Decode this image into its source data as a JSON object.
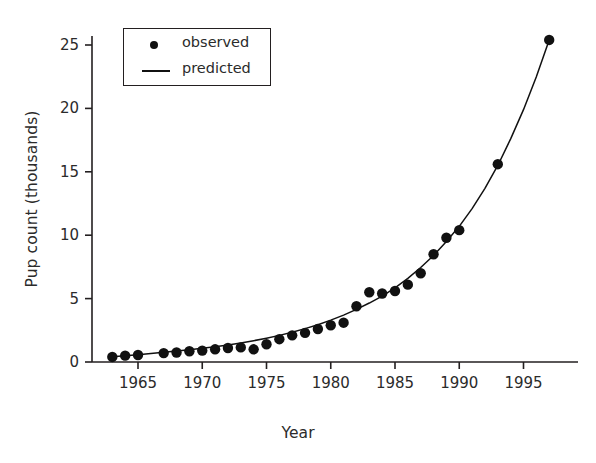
{
  "chart_data": {
    "type": "scatter",
    "title": "",
    "xlabel": "Year",
    "ylabel": "Pup count (thousands)",
    "xlim": [
      1962.0,
      1998.5
    ],
    "ylim": [
      -0.4,
      26.6
    ],
    "xticks": [
      1965,
      1970,
      1975,
      1980,
      1985,
      1990,
      1995
    ],
    "yticks": [
      0,
      5,
      10,
      15,
      20,
      25
    ],
    "xtick_labels": [
      "1965",
      "1970",
      "1975",
      "1980",
      "1985",
      "1990",
      "1995"
    ],
    "ytick_labels": [
      "0",
      "5",
      "10",
      "15",
      "20",
      "25"
    ],
    "grid": false,
    "legend_position": "upper left",
    "legend": [
      {
        "label": "observed",
        "symbol": "dot"
      },
      {
        "label": "predicted",
        "symbol": "line"
      }
    ],
    "series": [
      {
        "name": "observed",
        "type": "scatter",
        "marker": "circle",
        "color": "#111111",
        "x": [
          1963,
          1964,
          1965,
          1967,
          1968,
          1969,
          1970,
          1971,
          1972,
          1973,
          1974,
          1975,
          1976,
          1977,
          1978,
          1979,
          1980,
          1981,
          1982,
          1983,
          1984,
          1985,
          1986,
          1987,
          1988,
          1989,
          1990,
          1993,
          1997
        ],
        "y": [
          0.4,
          0.5,
          0.55,
          0.7,
          0.75,
          0.85,
          0.9,
          1.0,
          1.1,
          1.15,
          1.0,
          1.4,
          1.8,
          2.1,
          2.3,
          2.6,
          2.9,
          3.1,
          4.4,
          5.5,
          5.4,
          5.6,
          6.1,
          7.0,
          8.5,
          9.8,
          10.4,
          15.6,
          25.4
        ]
      },
      {
        "name": "predicted",
        "type": "line",
        "color": "#111111",
        "x": [
          1963,
          1964,
          1965,
          1966,
          1967,
          1968,
          1969,
          1970,
          1971,
          1972,
          1973,
          1974,
          1975,
          1976,
          1977,
          1978,
          1979,
          1980,
          1981,
          1982,
          1983,
          1984,
          1985,
          1986,
          1987,
          1988,
          1989,
          1990,
          1991,
          1992,
          1993,
          1994,
          1995,
          1996,
          1997
        ],
        "y": [
          0.42,
          0.5,
          0.58,
          0.67,
          0.77,
          0.87,
          0.97,
          1.08,
          1.2,
          1.34,
          1.5,
          1.68,
          1.88,
          2.1,
          2.35,
          2.63,
          2.94,
          3.3,
          3.7,
          4.15,
          4.65,
          5.2,
          5.85,
          6.6,
          7.45,
          8.4,
          9.5,
          10.7,
          12.1,
          13.7,
          15.5,
          17.6,
          19.9,
          22.5,
          25.4
        ]
      }
    ]
  },
  "axes": {
    "ylabel_text": "Pup count (thousands)",
    "xlabel_text": "Year"
  }
}
